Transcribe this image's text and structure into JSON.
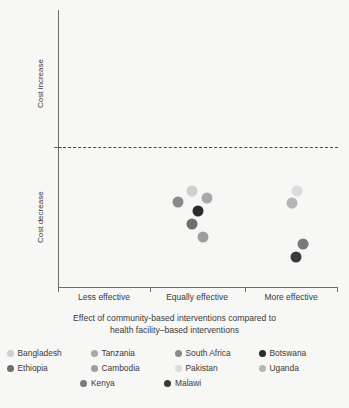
{
  "chart_data": {
    "type": "scatter",
    "title": "",
    "xlabel": "Effect of community-based interventions compared to health facility–based interventions",
    "xlabel_line1": "Effect of community-based interventions compared to",
    "xlabel_line2": "health facility–based interventions",
    "ylabel": "Change in cost per TB patient",
    "y_categories": [
      "Cost increase",
      "Cost decrease"
    ],
    "x_categories": [
      "Less effective",
      "Equally effective",
      "More effective"
    ],
    "grid": false,
    "reference_line": {
      "y": 0,
      "style": "dashed",
      "label": "no change in cost"
    },
    "ylim": [
      -1.0,
      1.0
    ],
    "legend_position": "bottom",
    "series": [
      {
        "name": "Bangladesh",
        "color": "#cfcfcf",
        "x": "Equally effective",
        "y": -0.26,
        "px": 192,
        "py": 191
      },
      {
        "name": "Tanzania",
        "color": "#a8a8a8",
        "x": "Equally effective",
        "y": -0.31,
        "px": 207,
        "py": 198
      },
      {
        "name": "South Africa",
        "color": "#8a8a8a",
        "x": "Equally effective",
        "y": -0.33,
        "px": 178,
        "py": 202
      },
      {
        "name": "Botswana",
        "color": "#2b2b2b",
        "x": "Equally effective",
        "y": -0.4,
        "px": 198,
        "py": 211
      },
      {
        "name": "Ethiopia",
        "color": "#6e6e6e",
        "x": "Equally effective",
        "y": -0.5,
        "px": 192,
        "py": 224
      },
      {
        "name": "Cambodia",
        "color": "#9e9e9e",
        "x": "Equally effective",
        "y": -0.6,
        "px": 203,
        "py": 237
      },
      {
        "name": "Pakistan",
        "color": "#dcdcdc",
        "x": "More effective",
        "y": -0.26,
        "px": 297,
        "py": 191
      },
      {
        "name": "Uganda",
        "color": "#b5b5b5",
        "x": "More effective",
        "y": -0.34,
        "px": 292,
        "py": 203
      },
      {
        "name": "Kenya",
        "color": "#7a7a7a",
        "x": "More effective",
        "y": -0.55,
        "px": 303,
        "py": 244
      },
      {
        "name": "Malawi",
        "color": "#3a3a3a",
        "x": "More effective",
        "y": -0.63,
        "px": 296,
        "py": 257
      }
    ],
    "legend_rows": [
      [
        "Bangladesh",
        "Tanzania",
        "South Africa",
        "Botswana"
      ],
      [
        "Ethiopia",
        "Cambodia",
        "Pakistan",
        "Uganda"
      ],
      [
        "Kenya",
        "Malawi"
      ]
    ]
  },
  "axes": {
    "x_ticks_px": [
      58,
      150,
      245,
      337
    ],
    "x_category_centers_px": [
      104,
      197,
      291
    ],
    "y_axis_top_px": 10,
    "y_axis_bottom_px": 287,
    "zero_line_px": 147
  },
  "colors": {
    "background": "#f7f7f5",
    "axis": "#6b6b6b",
    "text": "#3a3a3a",
    "reference_line": "#4a4a4a"
  }
}
